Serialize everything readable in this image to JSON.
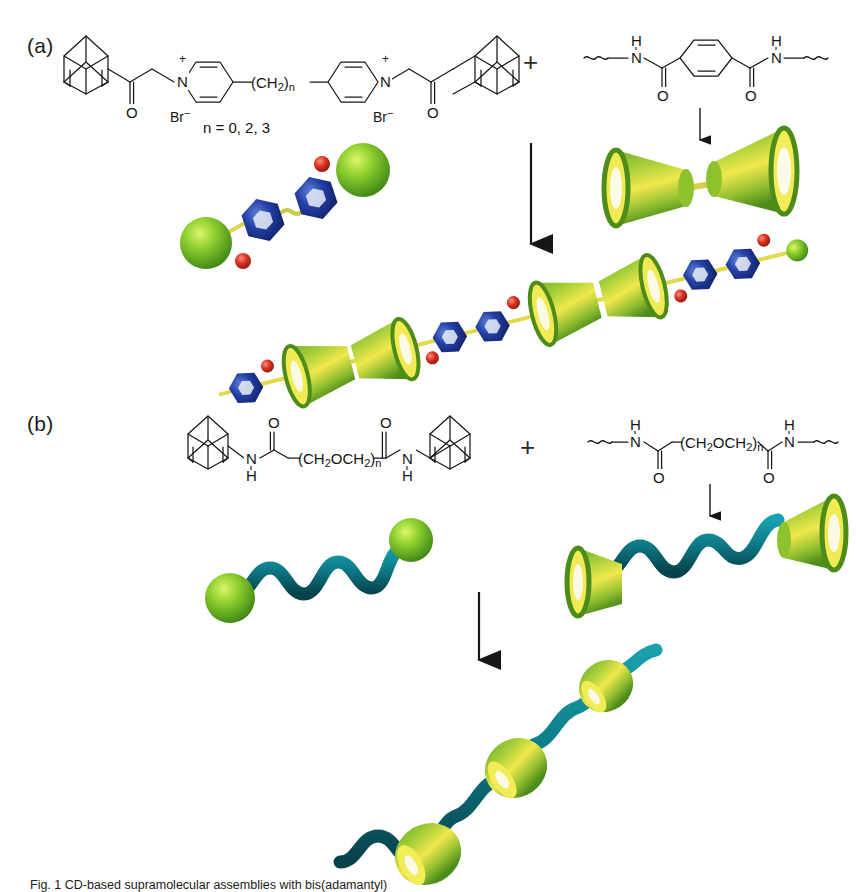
{
  "figure": {
    "width": 856,
    "height": 891,
    "background": "#ffffff",
    "caption": "Fig. 1 CD-based supramolecular assemblies with bis(adamantyl)"
  },
  "palette": {
    "line": "#181818",
    "adamantyl_sphere": "#6cc12b",
    "adamantyl_sphere_dark": "#3f8a18",
    "pyridinium_blue": "#1f3f9e",
    "pyridinium_blue_dark": "#12246b",
    "bromide_red": "#d32a1e",
    "cyclodextrin_green": "#5a9a22",
    "cyclodextrin_yellow": "#f2ea48",
    "chain_teal": "#0f7f8c",
    "chain_teal_dark": "#0a5560",
    "connector_yellow": "#e8e04a"
  },
  "panels": [
    {
      "id": "a",
      "label": "(a)",
      "guest": {
        "name": "bis(adamantyl) bipyridinium salt",
        "counterion_left": "Br",
        "counterion_left_charge": "−",
        "counterion_right": "Br",
        "counterion_right_charge": "−",
        "nitrogen_left": "N",
        "nitrogen_left_charge": "+",
        "nitrogen_right": "N",
        "nitrogen_right_charge": "+",
        "carbonyl_left": "O",
        "carbonyl_right": "O",
        "spacer": "(CH",
        "spacer_sub": "2",
        "spacer_close": ")",
        "spacer_n": "n",
        "n_values": "n = 0, 2, 3"
      },
      "operator": "+",
      "host": {
        "name": "cyclodextrin terephthalamide polymer",
        "amide_h_left": "H",
        "amide_n_left": "N",
        "amide_o_left": "O",
        "amide_h_right": "H",
        "amide_n_right": "N",
        "amide_o_right": "O"
      },
      "arrow": {
        "name": "reaction-arrow",
        "direction": "down"
      },
      "host_arrow": {
        "name": "host-model-arrow",
        "direction": "down"
      },
      "models": {
        "guest_model": "green-sphere-blue-hexagon-dumbbell",
        "host_model": "cyclodextrin-cone-dimer",
        "assembly_model": "pseudo-polyrotaxane-chain"
      }
    },
    {
      "id": "b",
      "label": "(b)",
      "guest": {
        "name": "bis(adamantyl) poly(ethylene glycol) diamide",
        "amide_n_left": "N",
        "amide_h_left": "H",
        "carbonyl_left": "O",
        "chain": "(CH",
        "chain_sub1": "2",
        "chain_mid": "OCH",
        "chain_sub2": "2",
        "chain_close": ")",
        "chain_n": "n",
        "carbonyl_right": "O",
        "amide_n_right": "N",
        "amide_h_right": "H"
      },
      "operator": "+",
      "host": {
        "name": "cyclodextrin PEG-diamide polymer",
        "amide_h_left": "H",
        "amide_n_left": "N",
        "amide_o_left": "O",
        "chain": "(CH",
        "chain_sub1": "2",
        "chain_mid": "OCH",
        "chain_sub2": "2",
        "chain_close": ")",
        "chain_n": "n",
        "amide_o_right": "O",
        "amide_n_right": "N",
        "amide_h_right": "H"
      },
      "arrow": {
        "name": "reaction-arrow",
        "direction": "down"
      },
      "host_arrow": {
        "name": "host-model-arrow",
        "direction": "down"
      },
      "models": {
        "guest_model": "teal-wavy-chain-green-spheres",
        "host_model": "teal-chain-cyclodextrin-cones",
        "assembly_model": "cyclodextrin-threaded-wavy-chain"
      }
    }
  ]
}
